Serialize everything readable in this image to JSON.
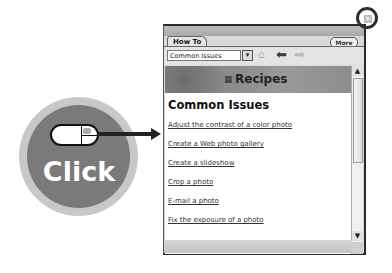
{
  "panel": {
    "tab_label": "How To",
    "more_label": "More",
    "select_value": "Common Issues",
    "select_arrow": "▾",
    "icons": {
      "home": "⌂",
      "back": "⬅",
      "forward": "➡"
    },
    "banner_icon": "▦",
    "banner_title": "Recipes",
    "heading": "Common Issues",
    "links": [
      "Adjust the contrast of a color photo",
      "Create a Web photo gallery",
      "Create a slideshow",
      "Crop a photo",
      "E-mail a photo",
      "Fix the exposure of a photo"
    ],
    "scroll_up": "▲",
    "scroll_down": "▼",
    "close_glyph": "✕"
  },
  "callout": {
    "label": "Click"
  }
}
